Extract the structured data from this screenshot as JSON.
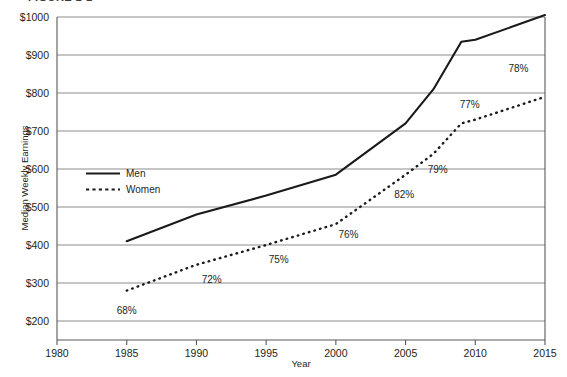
{
  "figure": {
    "caption_sliver": "FIGURE 1-1"
  },
  "chart_data": {
    "type": "line",
    "title": "",
    "xlabel": "Year",
    "ylabel": "Median Weekly Earnings",
    "xlim": [
      1980,
      2015
    ],
    "ylim": [
      150,
      1000
    ],
    "xticks": [
      1980,
      1985,
      1990,
      1995,
      2000,
      2005,
      2010,
      2015
    ],
    "xtick_labels": [
      "1980",
      "1985",
      "1990",
      "1995",
      "2000",
      "2005",
      "2010",
      "2015"
    ],
    "yticks": [
      200,
      300,
      400,
      500,
      600,
      700,
      800,
      900,
      1000
    ],
    "ytick_labels": [
      "$200",
      "$300",
      "$400",
      "$500",
      "$600",
      "$700",
      "$800",
      "$900",
      "$1000"
    ],
    "grid": true,
    "legend_position": "inside-left",
    "series": [
      {
        "name": "Men",
        "style": "solid",
        "x": [
          1985,
          1990,
          1995,
          2000,
          2005,
          2007,
          2009,
          2010,
          2015
        ],
        "values": [
          410,
          480,
          530,
          585,
          720,
          810,
          935,
          940,
          1005
        ]
      },
      {
        "name": "Women",
        "style": "dotted",
        "x": [
          1985,
          1990,
          1995,
          2000,
          2005,
          2007,
          2009,
          2010,
          2015
        ],
        "values": [
          280,
          348,
          400,
          455,
          585,
          640,
          720,
          730,
          790
        ]
      }
    ],
    "annotations": [
      {
        "label": "68%",
        "x": 1985,
        "y": 218
      },
      {
        "label": "72%",
        "x": 1991.1,
        "y": 300
      },
      {
        "label": "75%",
        "x": 1995.9,
        "y": 352
      },
      {
        "label": "76%",
        "x": 2000.9,
        "y": 418
      },
      {
        "label": "82%",
        "x": 2004.9,
        "y": 525
      },
      {
        "label": "79%",
        "x": 2007.3,
        "y": 590
      },
      {
        "label": "77%",
        "x": 2009.6,
        "y": 760
      },
      {
        "label": "78%",
        "x": 2013.1,
        "y": 855
      }
    ]
  }
}
